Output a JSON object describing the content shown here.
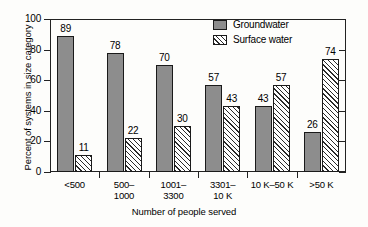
{
  "chart_data": {
    "type": "bar",
    "title": "",
    "xlabel": "Number of people served",
    "ylabel": "Percent of systems in size category",
    "ylim": [
      0,
      100
    ],
    "yticks": [
      0,
      20,
      40,
      60,
      80,
      100
    ],
    "grid": false,
    "legend_position": "top-center-right",
    "categories": [
      "<500",
      "500–\n1000",
      "1001–\n3300",
      "3301–\n10 K",
      "10 K–50 K",
      ">50 K"
    ],
    "series": [
      {
        "name": "Groundwater",
        "color": "#8d8d8d",
        "pattern": "solid",
        "values": [
          89,
          78,
          70,
          57,
          43,
          26
        ]
      },
      {
        "name": "Surface water",
        "color": "#ffffff",
        "pattern": "diagonal-hatch",
        "values": [
          11,
          22,
          30,
          43,
          57,
          74
        ]
      }
    ]
  },
  "axis": {
    "y_title": "Percent of systems in size category",
    "x_title": "Number of people served",
    "y_tick_labels": [
      "0",
      "20",
      "40",
      "60",
      "80",
      "100"
    ]
  },
  "legend": {
    "items": [
      {
        "label": "Groundwater",
        "swatch": "solid-gray-swatch"
      },
      {
        "label": "Surface water",
        "swatch": "hatched-swatch"
      }
    ]
  }
}
